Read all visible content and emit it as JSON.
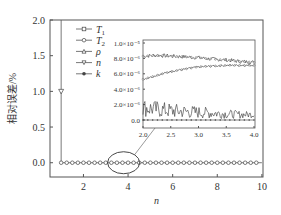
{
  "chart_data": [
    {
      "id": "main",
      "type": "line",
      "title": "",
      "xlabel": "n",
      "ylabel": "相对误差/%",
      "xlim": [
        0.5,
        10.05
      ],
      "ylim": [
        -0.2,
        2.0
      ],
      "xticks": [
        2,
        4,
        6,
        8,
        10
      ],
      "xtick_labels": [
        "2",
        "4",
        "6",
        "8",
        "10"
      ],
      "yticks": [
        0.0,
        0.5,
        1.0,
        1.5,
        2.0
      ],
      "ytick_labels": [
        "0.0",
        "0.5",
        "1.0",
        "1.5",
        "2.0"
      ],
      "grid": false,
      "legend_position": "top-left",
      "legend": [
        {
          "label": "T",
          "sub": "1",
          "marker": "square"
        },
        {
          "label": "T",
          "sub": "2",
          "marker": "circle"
        },
        {
          "label": "ρ",
          "sub": "",
          "marker": "triangle-up"
        },
        {
          "label": "n",
          "sub": "",
          "marker": "triangle-down"
        },
        {
          "label": "k",
          "sub": "",
          "marker": "filled-circle"
        }
      ],
      "series": [
        {
          "name": "T1",
          "x_start": 1,
          "x_end": 10,
          "x_step": 0.25,
          "value": 0.0,
          "spike": {
            "x": 1,
            "top": 2.0
          }
        },
        {
          "name": "T2",
          "x_start": 1,
          "x_end": 10,
          "x_step": 0.25,
          "value": 0.0
        },
        {
          "name": "ρ",
          "x_start": 1,
          "x_end": 10,
          "x_step": 0.25,
          "value": 0.0,
          "first_point": 1.0
        },
        {
          "name": "n",
          "x_start": 1,
          "x_end": 10,
          "x_step": 0.25,
          "value": 0.0
        },
        {
          "name": "k",
          "x_start": 1,
          "x_end": 10,
          "x_step": 0.25,
          "value": 0.0
        }
      ],
      "annotation": {
        "type": "ellipse",
        "center": [
          3.8,
          0.0
        ],
        "note": "zoom region 2.0–4.0 shown in inset"
      }
    },
    {
      "id": "inset",
      "type": "line",
      "xlim": [
        2.0,
        4.0
      ],
      "ylim": [
        0.0,
        1e-05
      ],
      "xticks": [
        2.0,
        2.5,
        3.0,
        3.5,
        4.0
      ],
      "xtick_labels": [
        "2.0",
        "2.5",
        "3.0",
        "3.5",
        "4.0"
      ],
      "yticks": [
        0.0,
        2e-06,
        4e-06,
        6e-06,
        8e-06,
        1e-05
      ],
      "ytick_labels": [
        "0.0",
        "2.0×10⁻⁶",
        "4.0×10⁻⁶",
        "6.0×10⁻⁶",
        "8.0×10⁻⁶",
        "1.0×10⁻⁵"
      ],
      "series": [
        {
          "name": "T1",
          "x": [
            2.0,
            2.25,
            2.5,
            2.75,
            3.0,
            3.25,
            3.5,
            3.75,
            4.0
          ],
          "y": [
            8.3e-06,
            8.4e-06,
            8.3e-06,
            8.2e-06,
            8.1e-06,
            7.9e-06,
            7.8e-06,
            7.6e-06,
            7.5e-06
          ],
          "noise": 2.5e-07
        },
        {
          "name": "T2",
          "x": [
            2.0,
            2.25,
            2.5,
            2.75,
            3.0,
            3.25,
            3.5,
            3.75,
            4.0
          ],
          "y": [
            5.3e-06,
            5.8e-06,
            6.3e-06,
            6.6e-06,
            6.9e-06,
            7e-06,
            7.1e-06,
            7.1e-06,
            7.1e-06
          ],
          "noise": 1.2e-07
        },
        {
          "name": "k",
          "x": [
            2.0,
            2.25,
            2.5,
            2.75,
            3.0,
            3.25,
            3.5,
            3.75,
            4.0
          ],
          "y": [
            1.6e-06,
            1.4e-06,
            1.2e-06,
            1.1e-06,
            1e-06,
            9e-07,
            8e-07,
            7e-07,
            7e-07
          ],
          "noise": 1e-06
        },
        {
          "name": "ρ / n",
          "x": [
            2.0,
            4.0
          ],
          "y": [
            0.0,
            0.0
          ],
          "noise": 0
        }
      ]
    }
  ]
}
